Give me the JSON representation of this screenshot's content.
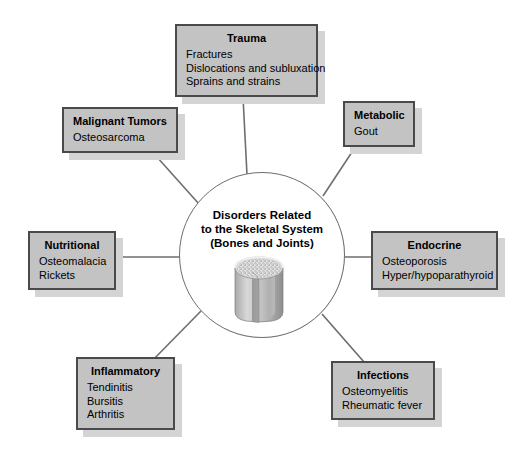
{
  "diagram": {
    "center": {
      "label": "center-node",
      "lines": [
        "Disorders Related",
        "to the Skeletal System",
        "(Bones and Joints)"
      ],
      "illustration": "bone-cross-section-icon"
    },
    "colors": {
      "box_fill": "#c3c3c3",
      "box_border": "#4a4a4a",
      "box_shadow": "#d4d4d4",
      "connector": "#6e6e6e",
      "circle_stroke": "#6e6e6e",
      "background": "#ffffff",
      "text": "#000000"
    },
    "nodes": [
      {
        "id": "trauma",
        "title": "Trauma",
        "items": [
          "Fractures",
          "Dislocations and subluxation",
          "Sprains and strains"
        ]
      },
      {
        "id": "malignant-tumors",
        "title": "Malignant Tumors",
        "items": [
          "Osteosarcoma"
        ]
      },
      {
        "id": "metabolic",
        "title": "Metabolic",
        "items": [
          "Gout"
        ]
      },
      {
        "id": "nutritional",
        "title": "Nutritional",
        "items": [
          "Osteomalacia",
          "Rickets"
        ]
      },
      {
        "id": "endocrine",
        "title": "Endocrine",
        "items": [
          "Osteoporosis",
          "Hyper/hypoparathyroid"
        ]
      },
      {
        "id": "inflammatory",
        "title": "Inflammatory",
        "items": [
          "Tendinitis",
          "Bursitis",
          "Arthritis"
        ]
      },
      {
        "id": "infections",
        "title": "Infections",
        "items": [
          "Osteomyelitis",
          "Rheumatic fever"
        ]
      }
    ]
  }
}
